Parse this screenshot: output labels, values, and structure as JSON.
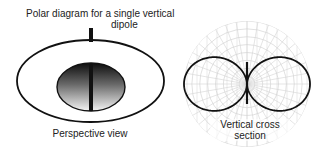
{
  "figure": {
    "title_line1": "Polar diagram for a single vertical",
    "title_line2": "dipole",
    "left_panel": {
      "caption": "Perspective view",
      "outer_ellipse": {
        "cx": 90.5,
        "cy": 81,
        "rx": 73.5,
        "ry": 41
      },
      "inner_ellipse": {
        "cx": 91,
        "cy": 87,
        "rx": 34,
        "ry": 24
      },
      "dipole_stub": {
        "x": 91,
        "y1": 28,
        "y2": 41
      }
    },
    "right_panel": {
      "caption_line1": "Vertical cross",
      "caption_line2": "section",
      "polar_grid": {
        "cx": 247,
        "cy": 84,
        "r": 63,
        "rings": 8,
        "spokes": 36
      },
      "lobe_pattern": "figure-eight (sin θ)",
      "dipole_line": {
        "x": 247,
        "y1": 62,
        "y2": 104
      }
    },
    "colors": {
      "line": "#111111",
      "grid": "#d4d4d4",
      "shade_dark": "#111111",
      "shade_light": "#f2f2f2"
    }
  }
}
